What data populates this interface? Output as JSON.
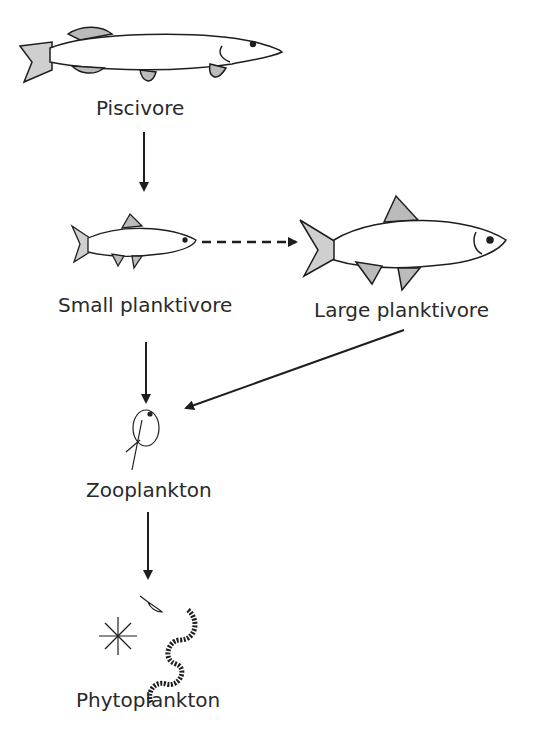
{
  "diagram": {
    "type": "food-web",
    "nodes": [
      {
        "id": "piscivore",
        "label": "Piscivore"
      },
      {
        "id": "small_planktivore",
        "label": "Small planktivore"
      },
      {
        "id": "large_planktivore",
        "label": "Large planktivore"
      },
      {
        "id": "zooplankton",
        "label": "Zooplankton"
      },
      {
        "id": "phytoplankton",
        "label": "Phytoplankton"
      }
    ],
    "edges": [
      {
        "from": "piscivore",
        "to": "small_planktivore",
        "style": "solid"
      },
      {
        "from": "small_planktivore",
        "to": "large_planktivore",
        "style": "dashed"
      },
      {
        "from": "small_planktivore",
        "to": "zooplankton",
        "style": "solid"
      },
      {
        "from": "large_planktivore",
        "to": "zooplankton",
        "style": "solid"
      },
      {
        "from": "zooplankton",
        "to": "phytoplankton",
        "style": "solid"
      }
    ]
  },
  "colors": {
    "ink": "#1e1e1e",
    "text": "#2a2a2a",
    "background": "#ffffff"
  }
}
